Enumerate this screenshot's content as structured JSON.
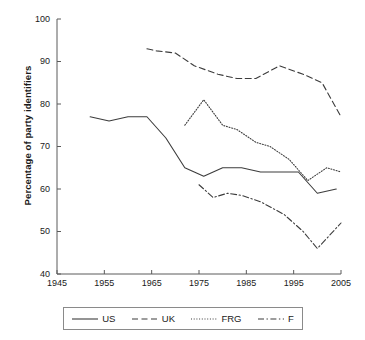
{
  "chart_data": {
    "type": "line",
    "title": "",
    "xlabel": "",
    "ylabel": "Percentage of party identifiers",
    "xlim": [
      1945,
      2005
    ],
    "ylim": [
      40,
      100
    ],
    "xticks": [
      1945,
      1955,
      1965,
      1975,
      1985,
      1995,
      2005
    ],
    "yticks": [
      40,
      50,
      60,
      70,
      80,
      90,
      100
    ],
    "grid": false,
    "legend_position": "below",
    "series": [
      {
        "name": "US",
        "style": "solid",
        "color": "#3c3c3c",
        "x": [
          1952,
          1956,
          1960,
          1964,
          1968,
          1972,
          1976,
          1980,
          1984,
          1988,
          1992,
          1996,
          2000,
          2004
        ],
        "y": [
          77,
          76,
          77,
          77,
          72,
          65,
          63,
          65,
          65,
          64,
          64,
          64,
          59,
          60
        ]
      },
      {
        "name": "UK",
        "style": "dashed",
        "color": "#3c3c3c",
        "x": [
          1964,
          1966,
          1970,
          1974,
          1979,
          1983,
          1987,
          1992,
          1997,
          2001,
          2005
        ],
        "y": [
          93,
          92.5,
          92,
          89,
          87,
          86,
          86,
          89,
          87,
          85,
          77
        ]
      },
      {
        "name": "FRG",
        "style": "dotted",
        "color": "#3c3c3c",
        "x": [
          1972,
          1976,
          1980,
          1983,
          1987,
          1990,
          1994,
          1998,
          2002,
          2005
        ],
        "y": [
          75,
          81,
          75,
          74,
          71,
          70,
          67,
          62,
          65,
          64
        ]
      },
      {
        "name": "F",
        "style": "dashdot",
        "color": "#3c3c3c",
        "x": [
          1975,
          1978,
          1981,
          1984,
          1988,
          1993,
          1997,
          2000,
          2005
        ],
        "y": [
          61,
          58,
          59,
          58.5,
          57,
          54,
          50,
          46,
          52
        ]
      }
    ]
  },
  "legend": {
    "items": [
      {
        "label": "US",
        "style": "solid"
      },
      {
        "label": "UK",
        "style": "dashed"
      },
      {
        "label": "FRG",
        "style": "dotted"
      },
      {
        "label": "F",
        "style": "dashdot"
      }
    ]
  }
}
